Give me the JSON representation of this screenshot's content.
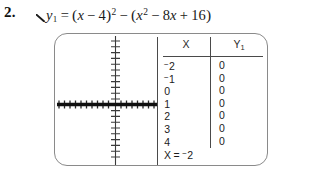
{
  "problem": {
    "number": "2.",
    "pointer_icon": "pointer-tick-icon"
  },
  "equation": {
    "lhs_var": "y",
    "lhs_sub": "1",
    "equals": "=",
    "t1_open": "(",
    "t1_var": "x",
    "t1_minus": "−",
    "t1_const": "4",
    "t1_close": ")",
    "t1_exp": "2",
    "mid_minus": "−",
    "t2_open": "(",
    "t2_var": "x",
    "t2_exp": "2",
    "t2_minus": "−",
    "t2_coef": "8",
    "t2_var2": "x",
    "t2_plus": "+",
    "t2_const": "16",
    "t2_close": ")",
    "plain": "y1 = (x - 4)^2 - (x^2 - 8x + 16)"
  },
  "calculator": {
    "graph": {
      "curve_label": "zero-line",
      "x_axis_label": "x-axis",
      "y_axis_label": "y-axis",
      "x_tick_count": 26,
      "y_tick_count": 22,
      "curve_y_value": 0,
      "axis_color": "#3a3a3a",
      "curve_color": "#111111"
    },
    "table": {
      "headers": {
        "x": "X",
        "y_main": "Y",
        "y_sub": "1"
      },
      "rows": [
        {
          "x_neg": "−",
          "x": "2",
          "y": "0"
        },
        {
          "x_neg": "−",
          "x": "1",
          "y": "0"
        },
        {
          "x_neg": "",
          "x": "0",
          "y": "0"
        },
        {
          "x_neg": "",
          "x": "1",
          "y": "0"
        },
        {
          "x_neg": "",
          "x": "2",
          "y": "0"
        },
        {
          "x_neg": "",
          "x": "3",
          "y": "0"
        },
        {
          "x_neg": "",
          "x": "4",
          "y": "0"
        }
      ],
      "status": {
        "var": "X",
        "equals": "=",
        "neg": "−",
        "value": "2"
      }
    }
  }
}
